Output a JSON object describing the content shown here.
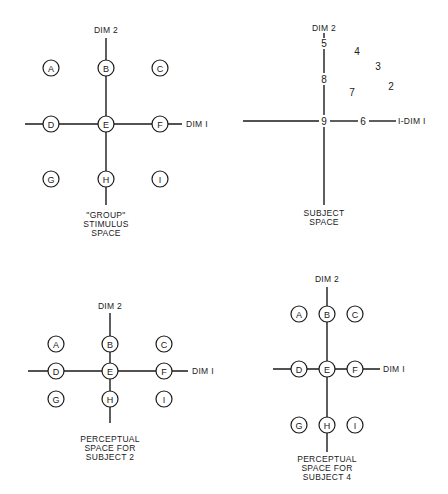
{
  "panels": {
    "group": {
      "dim2_label": "DIM 2",
      "dim1_label": "DIM I",
      "caption": [
        "\"GROUP\"",
        "STIMULUS",
        "SPACE"
      ],
      "stimuli": {
        "A": "A",
        "B": "B",
        "C": "C",
        "D": "D",
        "E": "E",
        "F": "F",
        "G": "G",
        "H": "H",
        "I": "I"
      }
    },
    "subject": {
      "dim2_label": "DIM 2",
      "dim1_label": "I-DIM I",
      "caption": [
        "SUBJECT",
        "SPACE"
      ],
      "subjects": {
        "s1": "1",
        "s2": "2",
        "s3": "3",
        "s4": "4",
        "s5": "5",
        "s6": "6",
        "s7": "7",
        "s8": "8",
        "s9": "9"
      }
    },
    "subject2": {
      "dim2_label": "DIM 2",
      "dim1_label": "DIM I",
      "caption": [
        "PERCEPTUAL",
        "SPACE FOR",
        "SUBJECT 2"
      ],
      "stimuli": {
        "A": "A",
        "B": "B",
        "C": "C",
        "D": "D",
        "E": "E",
        "F": "F",
        "G": "G",
        "H": "H",
        "I": "I"
      }
    },
    "subject4": {
      "dim2_label": "DIM 2",
      "dim1_label": "DIM I",
      "caption": [
        "PERCEPTUAL",
        "SPACE FOR",
        "SUBJECT 4"
      ],
      "stimuli": {
        "A": "A",
        "B": "B",
        "C": "C",
        "D": "D",
        "E": "E",
        "F": "F",
        "G": "G",
        "H": "H",
        "I": "I"
      }
    }
  }
}
